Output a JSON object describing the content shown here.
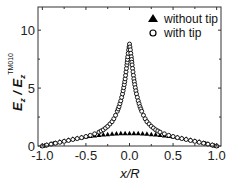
{
  "chart_data": {
    "type": "scatter",
    "title": "",
    "xlabel": "x/R",
    "ylabel": "E_z / E_z^TM010",
    "ylabel_parts": {
      "main": "E",
      "sub1": "z",
      "slash": " / ",
      "main2": "E",
      "sub2": "z",
      "sup2": "TM010"
    },
    "xlim": [
      -1.05,
      1.05
    ],
    "ylim": [
      0,
      12
    ],
    "xticks": [
      -1.0,
      -0.5,
      0.0,
      0.5,
      1.0
    ],
    "xtick_labels": [
      "-1.0",
      "-0.5",
      "0.0",
      "0.5",
      "1.0"
    ],
    "yticks": [
      0,
      5,
      10
    ],
    "ytick_labels": [
      "0",
      "5",
      "10"
    ],
    "grid": false,
    "legend_position": "upper right",
    "legend": [
      {
        "label": "without tip",
        "marker": "filled-triangle"
      },
      {
        "label": "with tip",
        "marker": "open-circle"
      }
    ],
    "series": [
      {
        "name": "without tip",
        "marker": "filled-triangle",
        "x": [
          -1.0,
          -0.95,
          -0.9,
          -0.85,
          -0.8,
          -0.75,
          -0.7,
          -0.65,
          -0.6,
          -0.55,
          -0.5,
          -0.45,
          -0.4,
          -0.35,
          -0.3,
          -0.25,
          -0.2,
          -0.15,
          -0.1,
          -0.05,
          0.0,
          0.05,
          0.1,
          0.15,
          0.2,
          0.25,
          0.3,
          0.35,
          0.4,
          0.45,
          0.5,
          0.55,
          0.6,
          0.65,
          0.7,
          0.75,
          0.8,
          0.85,
          0.9,
          0.95,
          1.0
        ],
        "y": [
          0.0,
          0.1,
          0.19,
          0.29,
          0.38,
          0.46,
          0.54,
          0.62,
          0.69,
          0.75,
          0.81,
          0.86,
          0.91,
          0.95,
          0.99,
          1.02,
          1.05,
          1.07,
          1.09,
          1.1,
          1.1,
          1.1,
          1.09,
          1.07,
          1.05,
          1.02,
          0.99,
          0.95,
          0.91,
          0.86,
          0.81,
          0.75,
          0.69,
          0.62,
          0.54,
          0.46,
          0.38,
          0.29,
          0.19,
          0.1,
          0.0
        ]
      },
      {
        "name": "with tip",
        "marker": "open-circle",
        "x": [
          -1.0,
          -0.95,
          -0.9,
          -0.85,
          -0.8,
          -0.75,
          -0.7,
          -0.65,
          -0.6,
          -0.55,
          -0.5,
          -0.45,
          -0.4,
          -0.35,
          -0.3,
          -0.25,
          -0.2,
          -0.18,
          -0.16,
          -0.14,
          -0.12,
          -0.1,
          -0.08,
          -0.06,
          -0.05,
          -0.04,
          -0.03,
          -0.02,
          -0.01,
          0.0,
          0.01,
          0.02,
          0.03,
          0.04,
          0.05,
          0.06,
          0.08,
          0.1,
          0.12,
          0.14,
          0.16,
          0.18,
          0.2,
          0.25,
          0.3,
          0.35,
          0.4,
          0.45,
          0.5,
          0.55,
          0.6,
          0.65,
          0.7,
          0.75,
          0.8,
          0.85,
          0.9,
          0.95,
          1.0
        ],
        "y": [
          0.0,
          0.08,
          0.16,
          0.24,
          0.32,
          0.4,
          0.48,
          0.56,
          0.64,
          0.72,
          0.82,
          0.92,
          1.05,
          1.2,
          1.4,
          1.7,
          2.1,
          2.35,
          2.65,
          3.0,
          3.4,
          3.9,
          4.5,
          5.3,
          5.8,
          6.4,
          7.0,
          7.7,
          8.3,
          8.8,
          8.3,
          7.7,
          7.0,
          6.4,
          5.8,
          5.3,
          4.5,
          3.9,
          3.4,
          3.0,
          2.65,
          2.35,
          2.1,
          1.7,
          1.4,
          1.2,
          1.05,
          0.92,
          0.82,
          0.72,
          0.64,
          0.56,
          0.48,
          0.4,
          0.32,
          0.24,
          0.16,
          0.08,
          0.0
        ]
      }
    ],
    "layout": {
      "plot_left": 38,
      "plot_right": 221,
      "plot_top": 7,
      "plot_bottom": 146
    }
  }
}
